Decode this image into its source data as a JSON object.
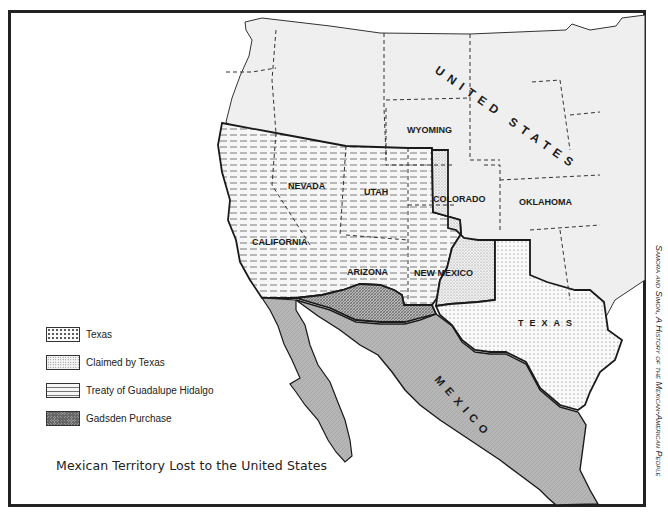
{
  "map": {
    "title": "Mexican Territory Lost to the United States",
    "source_credit": "Samora and Simon, A History of the Mexican-American People",
    "region_labels": {
      "united_states": "UNITED STATES",
      "mexico": "MEXICO",
      "texas": "TEXAS",
      "wyoming": "WYOMING",
      "colorado": "COLORADO",
      "oklahoma": "OKLAHOMA",
      "nevada": "NEVADA",
      "utah": "UTAH",
      "california": "CALIFORNIA",
      "arizona": "ARIZONA",
      "new_mexico": "NEW MEXICO"
    },
    "legend": [
      {
        "label": "Texas",
        "pattern": "sparse-dots"
      },
      {
        "label": "Claimed by Texas",
        "pattern": "fine-stipple"
      },
      {
        "label": "Treaty of Guadalupe Hidalgo",
        "pattern": "horizontal-dashes"
      },
      {
        "label": "Gadsden Purchase",
        "pattern": "dense-crosshatch"
      }
    ],
    "colors": {
      "land_us": "#efefef",
      "mexico_fill": "#b4b4b4",
      "border": "#1a1a1a",
      "background": "#ffffff"
    }
  }
}
